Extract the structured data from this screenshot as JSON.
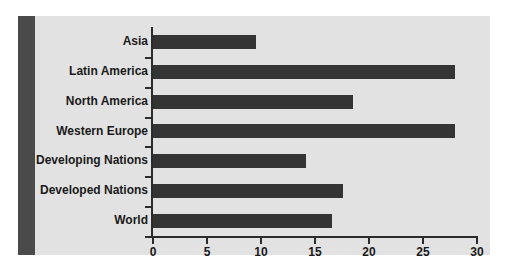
{
  "chart_data": {
    "type": "bar",
    "orientation": "horizontal",
    "title": "",
    "subtitle": "",
    "xlabel": "",
    "ylabel": "",
    "categories": [
      "Asia",
      "Latin America",
      "North America",
      "Western Europe",
      "Developing Nations",
      "Developed Nations",
      "World"
    ],
    "values": [
      9.5,
      28.0,
      18.5,
      28.0,
      14.2,
      17.6,
      16.6
    ],
    "xlim": [
      0,
      30
    ],
    "xticks": [
      0,
      5,
      10,
      15,
      20,
      25,
      30
    ],
    "xticklabels": [
      "0",
      "5",
      "10",
      "15",
      "20",
      "25",
      "30"
    ],
    "grid": false,
    "legend": null,
    "series": [
      {
        "name": "",
        "values": [
          9.5,
          28.0,
          18.5,
          28.0,
          14.2,
          17.6,
          16.6
        ]
      }
    ]
  },
  "style": {
    "panel_background": "#e2e2e2",
    "accent_band_color": "#4a4a4a",
    "bar_color": "#343434",
    "axis_color": "#2b2b2b",
    "text_color": "#1a1a1a",
    "figure_background": "#ffffff"
  }
}
